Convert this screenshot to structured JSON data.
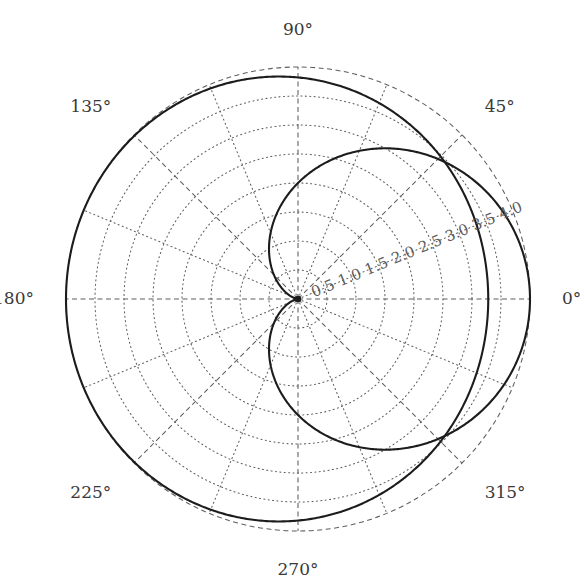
{
  "figure": {
    "background_color": "#ffffff",
    "curve_color": "#1c1c1c",
    "grid_color": "#5e5e5e",
    "label_color": "#3a3a3a",
    "radial_label_color": "#5a5a5a",
    "center_x": 298,
    "center_y": 299,
    "outer_radius_px": 232
  },
  "angular_axis": {
    "unit": "degrees",
    "direction": "counterclockwise",
    "zero_location": "E",
    "ticks": [
      {
        "label": "0°",
        "value": 0
      },
      {
        "label": "45°",
        "value": 45
      },
      {
        "label": "90°",
        "value": 90
      },
      {
        "label": "135°",
        "value": 135
      },
      {
        "label": "180°",
        "value": 180
      },
      {
        "label": "225°",
        "value": 225
      },
      {
        "label": "270°",
        "value": 270
      },
      {
        "label": "315°",
        "value": 315
      }
    ],
    "minor_spokes_every_deg": 22.5
  },
  "radial_axis": {
    "ticks": [
      {
        "label": "0.5",
        "value": 0.5
      },
      {
        "label": "1.0",
        "value": 1.0
      },
      {
        "label": "1.5",
        "value": 1.5
      },
      {
        "label": "2.0",
        "value": 2.0
      },
      {
        "label": "2.5",
        "value": 2.5
      },
      {
        "label": "3.0",
        "value": 3.0
      },
      {
        "label": "3.5",
        "value": 3.5
      },
      {
        "label": "4.0",
        "value": 4.0
      }
    ],
    "rmin": 0,
    "rmax": 4.0,
    "label_angle_deg": 22.5
  },
  "chart_data": {
    "type": "line",
    "subtype": "polar",
    "title": "",
    "xlabel": "",
    "ylabel": "",
    "grid": true,
    "legend": "none",
    "theta_unit": "degrees",
    "rlim": [
      0,
      4.0
    ],
    "thetalim": [
      0,
      360
    ],
    "series": [
      {
        "name": "inner-cardioid",
        "equation": "r = 2(1 + cosθ)",
        "color": "#1c1c1c",
        "theta": [
          0,
          15,
          30,
          45,
          60,
          75,
          90,
          105,
          120,
          135,
          150,
          165,
          180,
          195,
          210,
          225,
          240,
          255,
          270,
          285,
          300,
          315,
          330,
          345,
          360
        ],
        "r": [
          4.0,
          3.93,
          3.73,
          3.41,
          3.0,
          2.52,
          2.0,
          1.48,
          1.0,
          0.59,
          0.27,
          0.07,
          0.0,
          0.07,
          0.27,
          0.59,
          1.0,
          1.48,
          2.0,
          2.52,
          3.0,
          3.41,
          3.73,
          3.93,
          4.0
        ]
      },
      {
        "name": "outer-limacon",
        "equation": "r = 4 - 0.18(1 + cosθ)^2",
        "color": "#1c1c1c",
        "theta": [
          0,
          15,
          30,
          45,
          60,
          75,
          90,
          105,
          120,
          135,
          150,
          165,
          180,
          195,
          210,
          225,
          240,
          255,
          270,
          285,
          300,
          315,
          330,
          345,
          360
        ],
        "r": [
          4.0,
          3.96,
          3.92,
          3.9,
          3.9,
          3.92,
          3.95,
          3.97,
          3.99,
          4.0,
          4.0,
          4.0,
          4.0,
          4.0,
          4.0,
          4.0,
          3.99,
          3.97,
          3.95,
          3.92,
          3.9,
          3.9,
          3.92,
          3.96,
          4.0
        ]
      }
    ],
    "annotations": [
      {
        "text": "origin-cusp",
        "theta": 180,
        "r": 0
      }
    ]
  }
}
